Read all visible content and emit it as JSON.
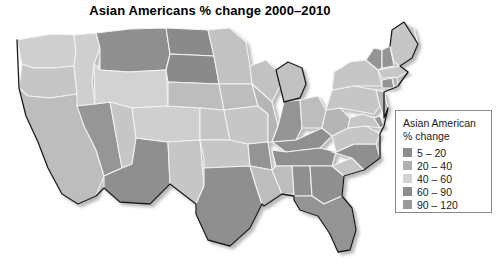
{
  "title": "Asian Americans % change 2000–2010",
  "legend": {
    "title_line1": "Asian American",
    "title_line2": "% change",
    "items": [
      {
        "label": "5 – 20",
        "color": "#8c8c8c",
        "min": 5,
        "max": 20
      },
      {
        "label": "20 – 40",
        "color": "#b0b0b0",
        "min": 20,
        "max": 40
      },
      {
        "label": "40 – 60",
        "color": "#d2d2d2",
        "min": 40,
        "max": 60
      },
      {
        "label": "60 – 90",
        "color": "#8c8c8c",
        "min": 60,
        "max": 90
      },
      {
        "label": "90 – 120",
        "color": "#9a9a9a",
        "min": 90,
        "max": 120
      }
    ]
  },
  "chart_data": {
    "type": "map",
    "title": "Asian Americans % change 2000–2010",
    "variable": "Asian American % change",
    "units": "percent",
    "legend_position": "right",
    "bins": [
      {
        "label": "5 – 20",
        "color": "#8c8c8c"
      },
      {
        "label": "20 – 40",
        "color": "#b0b0b0"
      },
      {
        "label": "40 – 60",
        "color": "#d2d2d2"
      },
      {
        "label": "60 – 90",
        "color": "#8c8c8c"
      },
      {
        "label": "90 – 120",
        "color": "#9a9a9a"
      }
    ],
    "regions": [
      {
        "name": "Washington",
        "bin": "40 – 60",
        "color": "#cfcfcf"
      },
      {
        "name": "Oregon",
        "bin": "40 – 60",
        "color": "#c6c6c6"
      },
      {
        "name": "California",
        "bin": "20 – 40",
        "color": "#bdbdbd"
      },
      {
        "name": "Idaho",
        "bin": "40 – 60",
        "color": "#cfcfcf"
      },
      {
        "name": "Nevada",
        "bin": "60 – 90",
        "color": "#969696"
      },
      {
        "name": "Montana",
        "bin": "20 – 40",
        "color": "#8f8f8f"
      },
      {
        "name": "Wyoming",
        "bin": "40 – 60",
        "color": "#d2d2d2"
      },
      {
        "name": "Utah",
        "bin": "40 – 60",
        "color": "#c6c6c6"
      },
      {
        "name": "Arizona",
        "bin": "60 – 90",
        "color": "#8f8f8f"
      },
      {
        "name": "Colorado",
        "bin": "40 – 60",
        "color": "#cfcfcf"
      },
      {
        "name": "New Mexico",
        "bin": "40 – 60",
        "color": "#c6c6c6"
      },
      {
        "name": "North Dakota",
        "bin": "90 – 120",
        "color": "#8a8a8a"
      },
      {
        "name": "South Dakota",
        "bin": "90 – 120",
        "color": "#8a8a8a"
      },
      {
        "name": "Nebraska",
        "bin": "40 – 60",
        "color": "#bdbdbd"
      },
      {
        "name": "Kansas",
        "bin": "40 – 60",
        "color": "#c6c6c6"
      },
      {
        "name": "Oklahoma",
        "bin": "40 – 60",
        "color": "#c6c6c6"
      },
      {
        "name": "Texas",
        "bin": "60 – 90",
        "color": "#8f8f8f"
      },
      {
        "name": "Minnesota",
        "bin": "40 – 60",
        "color": "#c2c2c2"
      },
      {
        "name": "Iowa",
        "bin": "40 – 60",
        "color": "#bdbdbd"
      },
      {
        "name": "Missouri",
        "bin": "40 – 60",
        "color": "#c6c6c6"
      },
      {
        "name": "Arkansas",
        "bin": "60 – 90",
        "color": "#949494"
      },
      {
        "name": "Louisiana",
        "bin": "20 – 40",
        "color": "#bdbdbd"
      },
      {
        "name": "Wisconsin",
        "bin": "40 – 60",
        "color": "#c2c2c2"
      },
      {
        "name": "Illinois",
        "bin": "20 – 40",
        "color": "#b5b5b5"
      },
      {
        "name": "Michigan",
        "bin": "40 – 60",
        "color": "#c2c2c2"
      },
      {
        "name": "Indiana",
        "bin": "60 – 90",
        "color": "#949494"
      },
      {
        "name": "Ohio",
        "bin": "40 – 60",
        "color": "#bdbdbd"
      },
      {
        "name": "Kentucky",
        "bin": "60 – 90",
        "color": "#8f8f8f"
      },
      {
        "name": "Tennessee",
        "bin": "60 – 90",
        "color": "#8f8f8f"
      },
      {
        "name": "Mississippi",
        "bin": "20 – 40",
        "color": "#bdbdbd"
      },
      {
        "name": "Alabama",
        "bin": "60 – 90",
        "color": "#8f8f8f"
      },
      {
        "name": "Georgia",
        "bin": "60 – 90",
        "color": "#8f8f8f"
      },
      {
        "name": "Florida",
        "bin": "60 – 90",
        "color": "#949494"
      },
      {
        "name": "South Carolina",
        "bin": "40 – 60",
        "color": "#c6c6c6"
      },
      {
        "name": "North Carolina",
        "bin": "60 – 90",
        "color": "#8f8f8f"
      },
      {
        "name": "Virginia",
        "bin": "40 – 60",
        "color": "#c6c6c6"
      },
      {
        "name": "West Virginia",
        "bin": "20 – 40",
        "color": "#b5b5b5"
      },
      {
        "name": "Maryland",
        "bin": "40 – 60",
        "color": "#c6c6c6"
      },
      {
        "name": "Delaware",
        "bin": "60 – 90",
        "color": "#949494"
      },
      {
        "name": "Pennsylvania",
        "bin": "40 – 60",
        "color": "#c6c6c6"
      },
      {
        "name": "New Jersey",
        "bin": "20 – 40",
        "color": "#b5b5b5"
      },
      {
        "name": "New York",
        "bin": "40 – 60",
        "color": "#c6c6c6"
      },
      {
        "name": "Connecticut",
        "bin": "60 – 90",
        "color": "#949494"
      },
      {
        "name": "Rhode Island",
        "bin": "20 – 40",
        "color": "#b5b5b5"
      },
      {
        "name": "Massachusetts",
        "bin": "40 – 60",
        "color": "#c6c6c6"
      },
      {
        "name": "Vermont",
        "bin": "60 – 90",
        "color": "#949494"
      },
      {
        "name": "New Hampshire",
        "bin": "60 – 90",
        "color": "#949494"
      },
      {
        "name": "Maine",
        "bin": "40 – 60",
        "color": "#c6c6c6"
      }
    ]
  }
}
